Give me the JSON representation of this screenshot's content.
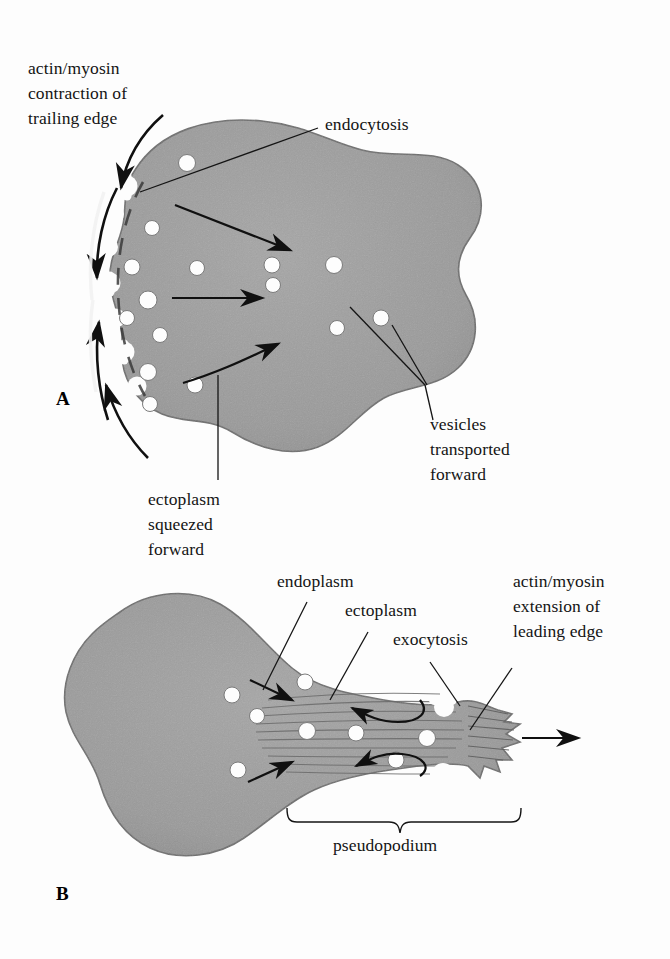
{
  "figure": {
    "title_present": false,
    "background_color": "#fdfdfd",
    "cell_fill_color": "#9a9a9a",
    "cell_outline_color": "#5d5d5d",
    "vesicle_color": "#ffffff",
    "arrow_color": "#101010",
    "text_color": "#141414"
  },
  "panels": [
    {
      "letter": "A",
      "labels": {
        "trailing_edge": "actin/myosin\ncontraction of\ntrailing edge",
        "endocytosis": "endocytosis",
        "vesicles": "vesicles\ntransported\nforward",
        "ectoplasm": "ectoplasm\nsqueezed\nforward"
      }
    },
    {
      "letter": "B",
      "labels": {
        "endoplasm": "endoplasm",
        "ectoplasm": "ectoplasm",
        "exocytosis": "exocytosis",
        "leading_edge": "actin/myosin\nextension of\nleading edge",
        "pseudopodium": "pseudopodium"
      }
    }
  ],
  "icons": {
    "transport_arrow": "arrow-right-icon",
    "contraction_arrow": "curved-arrow-icon",
    "recycle_arrow": "curved-return-arrow-icon",
    "motion_arrow": "arrow-right-icon",
    "brace": "curly-brace-icon"
  }
}
